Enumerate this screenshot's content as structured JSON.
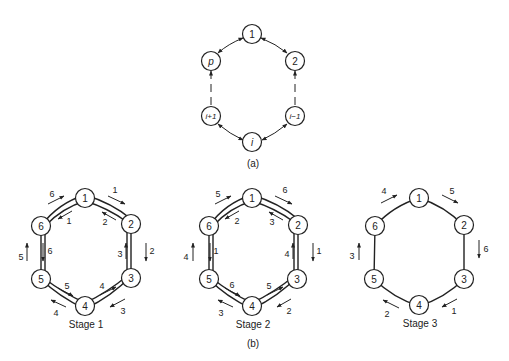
{
  "figure_a": {
    "caption": "(a)",
    "nodes": [
      "1",
      "2",
      "i−1",
      "i",
      "i+1",
      "p"
    ],
    "edges": "bidirectional ring; dashed segments between 2 and i−1 and between i+1 and p"
  },
  "figure_b": {
    "caption": "(b)",
    "stages": [
      {
        "label": "Stage 1",
        "nodes": [
          "1",
          "2",
          "3",
          "4",
          "5",
          "6"
        ],
        "arrow_labels": {
          "outer_1_2": "1",
          "inner_2_1": "2",
          "outer_2_3": "2",
          "inner_3_2": "3",
          "outer_3_4": "3",
          "inner_4_3": "4",
          "outer_4_5": "4",
          "inner_5_4": "5",
          "outer_5_6": "5",
          "inner_6_5": "6",
          "outer_6_1": "6",
          "inner_1_6": "1"
        }
      },
      {
        "label": "Stage 2",
        "nodes": [
          "1",
          "2",
          "3",
          "4",
          "5",
          "6"
        ],
        "arrow_labels": {
          "outer_1_2": "6",
          "inner_2_1": "3",
          "outer_2_3": "1",
          "inner_3_2": "4",
          "outer_3_4": "2",
          "inner_4_3": "5",
          "outer_4_5": "3",
          "inner_5_4": "6",
          "outer_5_6": "4",
          "inner_6_5": "1",
          "outer_6_1": "5",
          "inner_1_6": "2"
        }
      },
      {
        "label": "Stage 3",
        "nodes": [
          "1",
          "2",
          "3",
          "4",
          "5",
          "6"
        ],
        "arrow_labels": {
          "outer_1_2": "5",
          "outer_2_3": "6",
          "outer_3_4": "1",
          "outer_4_5": "2",
          "outer_5_6": "3",
          "outer_6_1": "4"
        }
      }
    ]
  }
}
